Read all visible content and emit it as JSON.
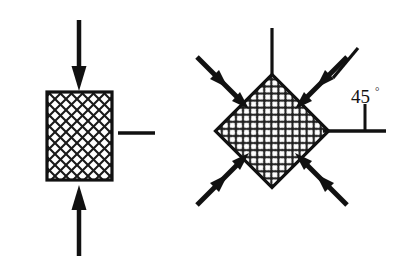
{
  "figure": {
    "background_color": "#ffffff",
    "stroke_color": "#111111"
  },
  "left_panel": {
    "name": "unrotated-element",
    "element": {
      "shape": "square",
      "hatch_pattern": "cross-hatch",
      "center_x": 79.5,
      "center_y": 136,
      "width": 65,
      "height": 88,
      "border_width": 3
    },
    "arrows": [
      {
        "name": "top-compression-arrow",
        "direction": "down",
        "x1": 79,
        "y1": 20,
        "x2": 79,
        "y2": 90
      },
      {
        "name": "bottom-compression-arrow",
        "direction": "up",
        "x1": 79,
        "y1": 256,
        "x2": 79,
        "y2": 186
      }
    ],
    "reference_lines": [
      {
        "name": "right-horizontal-reference-line",
        "x1": 118,
        "y1": 133,
        "x2": 155,
        "y2": 133
      }
    ]
  },
  "right_panel": {
    "name": "rotated-element",
    "element": {
      "shape": "square",
      "rotation_deg": 45,
      "hatch_pattern": "cross-hatch",
      "center_x": 272,
      "center_y": 131,
      "side": 80,
      "border_width": 3
    },
    "arrows": [
      {
        "name": "arrow-top-left-outer",
        "angle_deg": 45,
        "pair": "top-left"
      },
      {
        "name": "arrow-top-left-inner",
        "angle_deg": 45,
        "pair": "top-left"
      },
      {
        "name": "arrow-top-right-outer",
        "angle_deg": 135,
        "pair": "top-right"
      },
      {
        "name": "arrow-top-right-inner",
        "angle_deg": 135,
        "pair": "top-right"
      },
      {
        "name": "arrow-bottom-left-outer",
        "angle_deg": 315,
        "pair": "bottom-left"
      },
      {
        "name": "arrow-bottom-left-inner",
        "angle_deg": 315,
        "pair": "bottom-left"
      },
      {
        "name": "arrow-bottom-right-outer",
        "angle_deg": 225,
        "pair": "bottom-right"
      },
      {
        "name": "arrow-bottom-right-inner",
        "angle_deg": 225,
        "pair": "bottom-right"
      }
    ],
    "reference_lines": [
      {
        "name": "top-vertical-reference-line",
        "x1": 272,
        "y1": 28,
        "x2": 272,
        "y2": 75
      },
      {
        "name": "right-horizontal-reference-line",
        "x1": 323,
        "y1": 131,
        "x2": 386,
        "y2": 131
      },
      {
        "name": "angle-upper-leg-line",
        "x1": 357,
        "y1": 50,
        "x2": 333,
        "y2": 78
      },
      {
        "name": "angle-vertex-tick-line",
        "x1": 365,
        "y1": 105,
        "x2": 365,
        "y2": 131
      }
    ],
    "angle_annotation": {
      "name": "angle-label",
      "value": "45",
      "unit": "°",
      "x": 356,
      "y": 97
    }
  }
}
